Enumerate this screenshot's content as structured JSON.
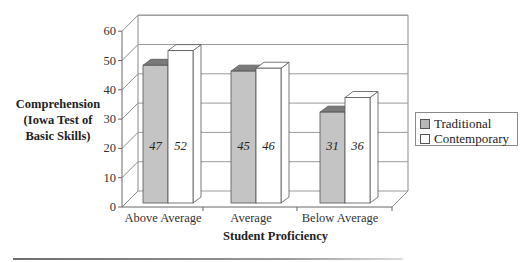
{
  "chart_data": {
    "type": "bar",
    "style": "3d-clustered-column",
    "title": "",
    "xlabel": "Student Proficiency",
    "ylabel": "Comprehension (Iowa Test of Basic Skills)",
    "ylabel_lines": [
      "Comprehension",
      "(Iowa Test of",
      "Basic Skills)"
    ],
    "categories": [
      "Above Average",
      "Average",
      "Below Average"
    ],
    "series": [
      {
        "name": "Traditional",
        "values": [
          47,
          45,
          31
        ],
        "color": "#c4c4c4",
        "top_color": "#7a7a7a"
      },
      {
        "name": "Contemporary",
        "values": [
          52,
          46,
          36
        ],
        "color": "#ffffff",
        "top_color": "#ffffff"
      }
    ],
    "data_labels": [
      [
        "47",
        "45",
        "31"
      ],
      [
        "52",
        "46",
        "36"
      ]
    ],
    "ylim": [
      0,
      60
    ],
    "yticks": [
      0,
      10,
      20,
      30,
      40,
      50,
      60
    ],
    "grid": true,
    "legend_position": "right"
  },
  "legend": {
    "items": [
      {
        "label": "Traditional",
        "color": "#b8b8b8"
      },
      {
        "label": "Contemporary",
        "color": "#ffffff"
      }
    ]
  }
}
